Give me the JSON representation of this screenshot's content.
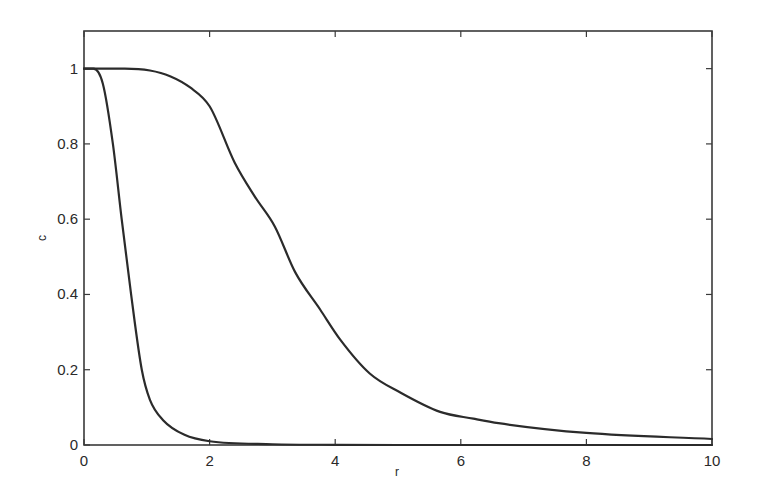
{
  "chart_data": {
    "type": "line",
    "title": "",
    "xlabel": "r",
    "ylabel": "c",
    "xlim": [
      0,
      10
    ],
    "ylim": [
      0,
      1.1
    ],
    "grid": false,
    "legend": null,
    "x_ticks": [
      0,
      2,
      4,
      6,
      8,
      10
    ],
    "x_tick_labels": [
      "0",
      "2",
      "4",
      "6",
      "8",
      "10"
    ],
    "y_ticks": [
      0,
      0.2,
      0.4,
      0.6,
      0.8,
      1
    ],
    "y_tick_labels": [
      "0",
      "0.2",
      "0.4",
      "0.6",
      "0.8",
      "1"
    ],
    "series": [
      {
        "name": "steep profile",
        "color": "#2b2b2b",
        "x": [
          0,
          0.15,
          0.3,
          0.46,
          0.6,
          0.75,
          0.92,
          1.05,
          1.26,
          1.6,
          2.0,
          3.0,
          4.0,
          6.0,
          8.0,
          10.0
        ],
        "y": [
          1,
          1,
          0.96,
          0.8,
          0.6,
          0.4,
          0.2,
          0.12,
          0.066,
          0.027,
          0.01,
          0.002,
          0.0005,
          0,
          0,
          0
        ]
      },
      {
        "name": "broad profile",
        "color": "#2b2b2b",
        "x": [
          0,
          0.65,
          1.05,
          1.37,
          1.69,
          2.0,
          2.4,
          2.72,
          3.04,
          3.36,
          3.76,
          4.08,
          4.55,
          5.03,
          5.67,
          6.2,
          6.6,
          8.0,
          10.0
        ],
        "y": [
          1,
          1,
          0.995,
          0.98,
          0.95,
          0.9,
          0.75,
          0.66,
          0.58,
          0.46,
          0.36,
          0.28,
          0.19,
          0.14,
          0.088,
          0.07,
          0.058,
          0.032,
          0.016
        ]
      }
    ]
  },
  "axes": {
    "x_label": "r",
    "y_label": "c"
  }
}
